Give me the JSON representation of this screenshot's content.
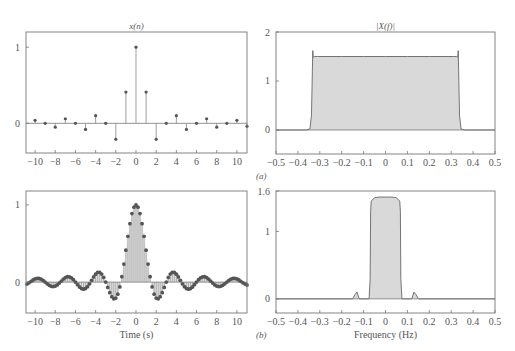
{
  "chart_data": [
    {
      "id": "tl",
      "type": "stem",
      "title": "x(n)",
      "xlabel": "",
      "ylabel": "",
      "frame": {
        "x0": 26,
        "x1": 247,
        "y0": 32,
        "y1": 153
      },
      "xlim": [
        -10.9,
        11.0
      ],
      "ylim": [
        -0.39,
        1.2
      ],
      "xticks": [
        -10,
        -8,
        -6,
        -4,
        -2,
        0,
        2,
        4,
        6,
        8,
        10
      ],
      "xtick_labels": [
        "−10",
        "−8",
        "−6",
        "−4",
        "−2",
        "0",
        "2",
        "4",
        "6",
        "8",
        "10"
      ],
      "yticks": [
        0,
        1
      ],
      "ytick_labels": [
        "0",
        "1"
      ],
      "x": [
        -10,
        -9,
        -8,
        -7,
        -6,
        -5,
        -4,
        -3,
        -2,
        -1,
        0,
        1,
        2,
        3,
        4,
        5,
        6,
        7,
        8,
        9,
        10,
        11
      ],
      "values": [
        0.04,
        0.0,
        -0.05,
        0.06,
        0.0,
        -0.08,
        0.1,
        0.0,
        -0.21,
        0.41,
        1.0,
        0.41,
        -0.21,
        0.0,
        0.1,
        -0.08,
        0.0,
        0.06,
        -0.05,
        0.0,
        0.04,
        -0.04
      ]
    },
    {
      "id": "tr",
      "type": "area",
      "title": "|X(f)|",
      "xlabel": "",
      "ylabel": "",
      "panel_tag": "(a)",
      "frame": {
        "x0": 276,
        "x1": 495,
        "y0": 32,
        "y1": 154
      },
      "xlim": [
        -0.5,
        0.5
      ],
      "ylim": [
        -0.49,
        2.0
      ],
      "xticks": [
        -0.5,
        -0.4,
        -0.3,
        -0.2,
        -0.1,
        0,
        0.1,
        0.2,
        0.3,
        0.4,
        0.5
      ],
      "xtick_labels": [
        "−0.5",
        "−0.4",
        "−0.3",
        "−0.2",
        "−0.1",
        "0",
        "0.1",
        "0.2",
        "0.3",
        "0.4",
        "0.5"
      ],
      "yticks": [
        0,
        1,
        2
      ],
      "ytick_labels": [
        "0",
        "1",
        "2"
      ],
      "x": [
        -0.5,
        -0.36,
        -0.345,
        -0.338,
        -0.334,
        -0.332,
        -0.33,
        -0.325,
        -0.31,
        -0.2,
        -0.1,
        0,
        0.1,
        0.2,
        0.31,
        0.325,
        0.33,
        0.332,
        0.334,
        0.338,
        0.345,
        0.36,
        0.5
      ],
      "values": [
        0,
        0,
        0.02,
        0.3,
        1.2,
        1.62,
        1.48,
        1.5,
        1.5,
        1.5,
        1.5,
        1.5,
        1.5,
        1.5,
        1.5,
        1.5,
        1.48,
        1.62,
        1.2,
        0.3,
        0.02,
        0,
        0
      ]
    },
    {
      "id": "bl",
      "type": "stem",
      "title": "",
      "xlabel": "Time (s)",
      "ylabel": "",
      "frame": {
        "x0": 26,
        "x1": 247,
        "y0": 191,
        "y1": 313
      },
      "xlim": [
        -10.9,
        11.0
      ],
      "ylim": [
        -0.4,
        1.18
      ],
      "xticks": [
        -10,
        -8,
        -6,
        -4,
        -2,
        0,
        2,
        4,
        6,
        8,
        10
      ],
      "xtick_labels": [
        "−10",
        "−8",
        "−6",
        "−4",
        "−2",
        "0",
        "2",
        "4",
        "6",
        "8",
        "10"
      ],
      "yticks": [
        0,
        1
      ],
      "ytick_labels": [
        "0",
        "1"
      ],
      "sample_step": 0.2,
      "function": "sin(2*pi*t/3)/(2*pi*t/3)",
      "x_range": [
        -10.8,
        11.0
      ]
    },
    {
      "id": "br",
      "type": "area",
      "title": "",
      "xlabel": "Frequency (Hz)",
      "ylabel": "",
      "panel_tag": "(b)",
      "frame": {
        "x0": 276,
        "x1": 495,
        "y0": 191,
        "y1": 313
      },
      "xlim": [
        -0.5,
        0.5
      ],
      "ylim": [
        -0.21,
        1.6
      ],
      "xticks": [
        -0.5,
        -0.4,
        -0.3,
        -0.2,
        -0.1,
        0,
        0.1,
        0.2,
        0.3,
        0.4,
        0.5
      ],
      "xtick_labels": [
        "−0.5",
        "−0.4",
        "−0.3",
        "−0.2",
        "−0.1",
        "0",
        "0.1",
        "0.2",
        "0.3",
        "0.4",
        "0.5"
      ],
      "yticks": [
        0,
        1,
        1.6
      ],
      "ytick_labels": [
        "0",
        "1",
        "1.6"
      ],
      "x": [
        -0.5,
        -0.15,
        -0.14,
        -0.13,
        -0.12,
        -0.075,
        -0.07,
        -0.068,
        -0.065,
        -0.05,
        -0.03,
        0,
        0.03,
        0.05,
        0.065,
        0.068,
        0.07,
        0.075,
        0.12,
        0.13,
        0.14,
        0.15,
        0.5
      ],
      "values": [
        0,
        0,
        0.06,
        0.1,
        0,
        0,
        0.3,
        1.3,
        1.45,
        1.5,
        1.51,
        1.51,
        1.51,
        1.5,
        1.45,
        1.3,
        0.3,
        0,
        0,
        0.1,
        0.06,
        0,
        0
      ]
    }
  ],
  "colors": {
    "axis": "#777777",
    "stem": "#888888",
    "marker": "#555555",
    "fill": "#d9d9d9",
    "curve": "#666666",
    "text": "#555555"
  }
}
